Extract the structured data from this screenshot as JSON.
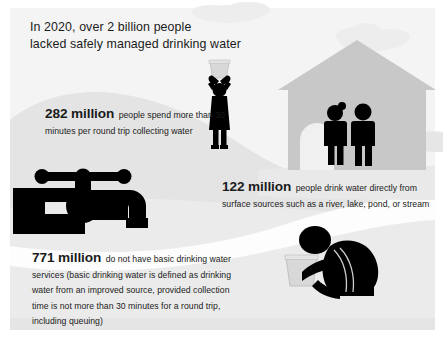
{
  "headline": {
    "line1": "In 2020, over 2 billion people",
    "line2": "lacked safely managed drinking water"
  },
  "stats": [
    {
      "id": "stat-282",
      "figure": "282 million",
      "text": "people spend more than 30 minutes per round trip collecting water"
    },
    {
      "id": "stat-122",
      "figure": "122 million",
      "text": "people drink water directly from surface sources such as a river, lake, pond, or stream"
    },
    {
      "id": "stat-771",
      "figure": "771 million",
      "text": "do not have basic drinking water services (basic drinking water is defined as drinking water from an improved source, provided collection time is not more than 30 minutes for a round trip, including queuing)"
    }
  ],
  "illustrations": {
    "house": "house-illustration",
    "couple": "two-people-illustration",
    "water_carrier": "person-carrying-bucket-illustration",
    "faucet": "faucet-tap-illustration",
    "kneeling_person": "kneeling-person-with-bucket-illustration",
    "clouds": "clouds-illustration",
    "hills": "hills-illustration",
    "river": "river-illustration"
  },
  "colors": {
    "text": "#1b1b1b",
    "silhouette": "#000000",
    "house_gray": "#c8c8c8",
    "hill_gray": "#e3e3e3",
    "hill_gray_dark": "#dcdcdc",
    "cloud_gray": "#ededed",
    "bucket_gray": "#d6d6d6",
    "background": "#f2f2f2",
    "river_white": "#fdfdfd"
  }
}
